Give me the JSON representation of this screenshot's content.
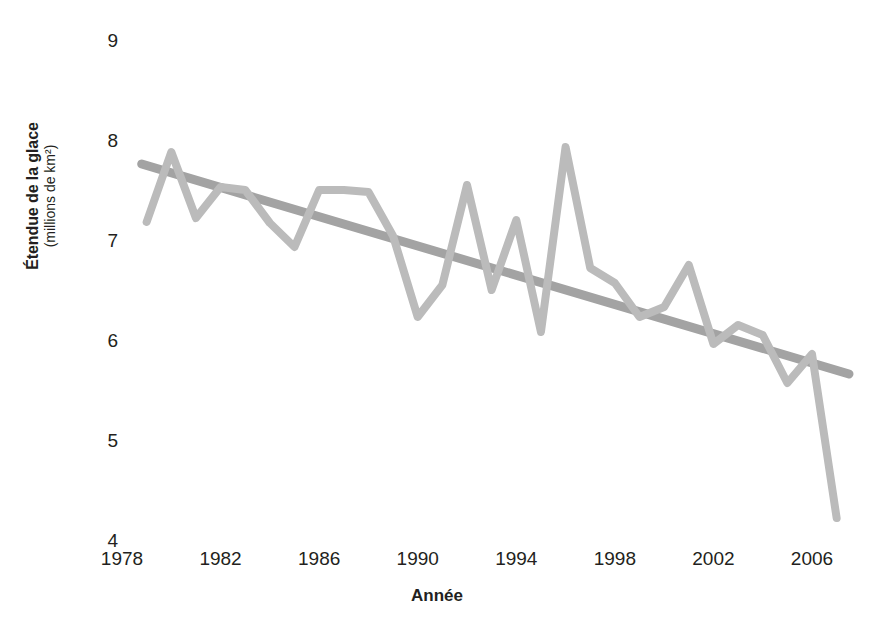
{
  "chart_data": {
    "type": "line",
    "title": "",
    "xlabel": "Année",
    "ylabel": "Étendue de la glace",
    "ylabel_sub": "(millions de km²)",
    "xlim": [
      1978,
      2007.2
    ],
    "ylim": [
      4,
      9
    ],
    "grid": false,
    "legend": "none",
    "xticks": [
      1978,
      1982,
      1986,
      1990,
      1994,
      1998,
      2002,
      2006
    ],
    "xtick_labels": [
      "1978",
      "1982",
      "1986",
      "1990",
      "1994",
      "1998",
      "2002",
      "2006"
    ],
    "yticks": [
      4,
      5,
      6,
      7,
      8,
      9
    ],
    "ytick_labels": [
      "4",
      "5",
      "6",
      "7",
      "8",
      "9"
    ],
    "series": [
      {
        "name": "Étendue de la glace",
        "kind": "line",
        "color": "#bbbbbb",
        "x": [
          1979,
          1980,
          1981,
          1982,
          1983,
          1984,
          1985,
          1986,
          1987,
          1988,
          1989,
          1990,
          1991,
          1992,
          1993,
          1994,
          1995,
          1996,
          1997,
          1998,
          1999,
          2000,
          2001,
          2002,
          2003,
          2004,
          2005,
          2006,
          2007
        ],
        "values": [
          7.18,
          7.88,
          7.22,
          7.53,
          7.5,
          7.17,
          6.93,
          7.5,
          7.5,
          7.48,
          7.04,
          6.23,
          6.55,
          7.55,
          6.5,
          7.2,
          6.08,
          7.93,
          6.72,
          6.57,
          6.23,
          6.33,
          6.75,
          5.96,
          6.15,
          6.05,
          5.57,
          5.86,
          4.22
        ]
      },
      {
        "name": "Tendance linéaire",
        "kind": "trend",
        "color": "#a3a3a3",
        "x": [
          1978.8,
          2007.5
        ],
        "values": [
          7.76,
          5.66
        ]
      }
    ]
  },
  "axes": {
    "y_title_main": "Étendue de la glace",
    "y_title_sub": "(millions de km²)",
    "x_title": "Année"
  }
}
